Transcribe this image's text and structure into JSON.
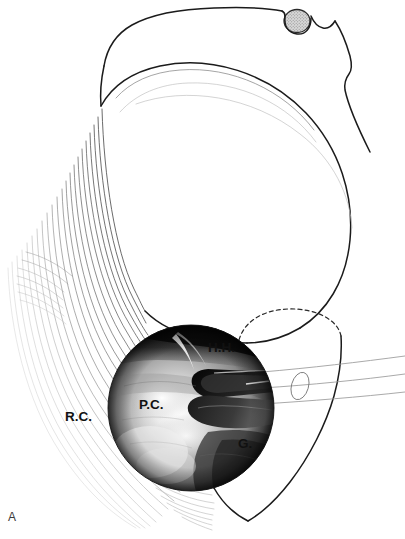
{
  "figure": {
    "panel_letter": "A",
    "kind": "shoulder-arthroscopy-illustration",
    "width": 405,
    "height": 539,
    "background_color": "#ffffff"
  },
  "labels": {
    "humeral_head": "H.H.",
    "posterior_capsule": "P.C.",
    "rotator_cuff": "R.C.",
    "glenoid": "G."
  },
  "label_positions": {
    "humeral_head": {
      "x": 208,
      "y": 352
    },
    "posterior_capsule": {
      "x": 139,
      "y": 409
    },
    "rotator_cuff": {
      "x": 65,
      "y": 421
    },
    "glenoid": {
      "x": 238,
      "y": 448
    },
    "panel_letter": {
      "x": 8,
      "y": 521
    }
  },
  "colors": {
    "outline_major": "#1b1b1b",
    "outline_minor": "#8e8e8e",
    "outline_faint": "#c2c2c2",
    "rim_dashed": "#2a2a2a",
    "label_text": "#111111",
    "panel_letter": "#3a3a3a",
    "scope_dark": "#0b0b0b",
    "scope_light": "#f2f2f2",
    "stipple_fill": "#b9b9b9"
  },
  "arthroscopic_inset": {
    "name": "arthroscopic-photograph",
    "shape": "circle",
    "center_x": 191,
    "center_y": 408,
    "radius": 83,
    "description": "Grayscale arthroscopic view of the posterior glenohumeral joint"
  },
  "structures": [
    {
      "name": "acromion-clavicle-outline",
      "kind": "line-drawing"
    },
    {
      "name": "humeral-head-outline",
      "kind": "line-drawing"
    },
    {
      "name": "acromioclavicular-joint-marker",
      "kind": "stippled-oval"
    },
    {
      "name": "rotator-cuff-tendon-fibers",
      "kind": "fiber-bundle"
    },
    {
      "name": "glenoid-rim-hidden",
      "kind": "dashed-arc"
    },
    {
      "name": "scapula-body-outline",
      "kind": "line-drawing"
    },
    {
      "name": "arthroscope-cannula",
      "kind": "tube"
    }
  ]
}
